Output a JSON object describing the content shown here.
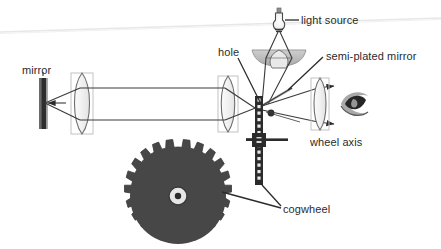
{
  "figure": {
    "background_color": "#ffffff",
    "width": 441,
    "height": 249
  },
  "labels": {
    "mirror": "mirror",
    "hole": "hole",
    "light_source": "light source",
    "semi_plated_mirror": "semi-plated mirror",
    "wheel_axis": "wheel axis",
    "cogwheel": "cogwheel"
  },
  "colors": {
    "ink": "#2b2b2b",
    "line": "#333333",
    "cogwheel_fill": "#474747",
    "mirror_fill": "#2e2e2e",
    "lens_outline": "#6e6e6e",
    "lens_frame": "#b9b9b9",
    "shade_fill": "#b4b4b4",
    "scan_artifact": "#e9e9e9"
  },
  "components": {
    "cogwheel": {
      "teeth": 18,
      "center_x": 178,
      "center_y": 196,
      "outer_radius": 49,
      "hub_outer_radius": 9,
      "hub_inner_radius": 3
    },
    "mirror": {
      "x": 42,
      "y_top": 78,
      "y_bottom": 128
    },
    "lenses": [
      {
        "name": "collimating-lens",
        "cx": 82,
        "cy": 103
      },
      {
        "name": "objective-lens",
        "cx": 228,
        "cy": 103
      },
      {
        "name": "eyepiece-lens",
        "cx": 320,
        "cy": 103
      },
      {
        "name": "condenser-lens",
        "cx": 279,
        "cy": 60
      }
    ],
    "light_bulb": {
      "cx": 279,
      "cy": 22
    },
    "eye": {
      "cx": 355,
      "cy": 103
    },
    "toothed_strip": {
      "x": 258,
      "y_top": 96,
      "y_bottom": 185
    },
    "axis_bar": {
      "y": 140,
      "x_left": 246,
      "x_right": 288
    }
  }
}
